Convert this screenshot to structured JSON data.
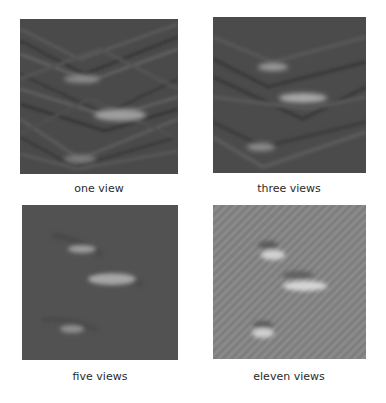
{
  "figure": {
    "panels": [
      {
        "id": "one",
        "caption": "one view",
        "background": "#4a4a4a",
        "style": "dark-streaky"
      },
      {
        "id": "three",
        "caption": "three views",
        "background": "#4b4b4b",
        "style": "dark-streaky"
      },
      {
        "id": "five",
        "caption": "five views",
        "background": "#525252",
        "style": "dark-smooth"
      },
      {
        "id": "eleven",
        "caption": "eleven views",
        "background": "#8a8a8a",
        "style": "light-textured"
      }
    ]
  }
}
